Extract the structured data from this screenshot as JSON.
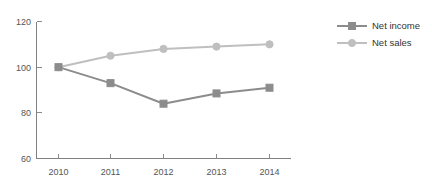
{
  "chart_data": {
    "type": "line",
    "title": "",
    "subtitle": "",
    "xlabel": "",
    "ylabel": "",
    "categories": [
      "2010",
      "2011",
      "2012",
      "2013",
      "2014"
    ],
    "x": [
      2010,
      2011,
      2012,
      2013,
      2014
    ],
    "ylim": [
      60,
      120
    ],
    "yticks": [
      60,
      80,
      100,
      120
    ],
    "ytick_labels": [
      "60",
      "80",
      "100",
      "120"
    ],
    "xtick_labels": [
      "2010",
      "2011",
      "2012",
      "2013",
      "2014"
    ],
    "grid": false,
    "legend_position": "right",
    "series": [
      {
        "name": "Net income",
        "color": "#8c8c8c",
        "marker": "square",
        "values": [
          100,
          93,
          84,
          88.5,
          91
        ]
      },
      {
        "name": "Net sales",
        "color": "#bfbfbf",
        "marker": "circle",
        "values": [
          100,
          105,
          108,
          109,
          110
        ]
      }
    ],
    "annotations": []
  },
  "axes": {
    "y_axis_name": "y-axis",
    "x_axis_name": "x-axis"
  },
  "legend": {
    "entries": [
      {
        "label": "Net income"
      },
      {
        "label": "Net sales"
      }
    ]
  },
  "colors": {
    "net_income": "#8c8c8c",
    "net_sales": "#bfbfbf",
    "axis": "#808080",
    "tick_text": "#555555",
    "legend_text": "#333333",
    "background": "#ffffff"
  }
}
